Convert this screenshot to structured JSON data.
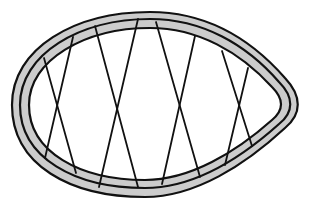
{
  "diagram": {
    "type": "teardrop-ring-with-crossed-struts",
    "colors": {
      "background": "#ffffff",
      "band_fill": "#cccccc",
      "stroke": "#111111"
    },
    "outer_path": "M 150 12 C 205 12 250 38 285 78 C 302 96 302 114 285 128 C 245 165 195 197 145 197 C 70 197 12 165 12 105 C 12 48 75 12 150 12 Z",
    "middle_path": "M 150 19 C 202 19 246 44 279 82 C 294 97 294 112 279 124 C 240 159 193 188 145 188 C 75 188 20 158 20 105 C 20 54 80 19 150 19 Z",
    "inner_path": "M 150 28 C 198 28 240 52 272 87 C 284 99 284 110 272 120 C 236 152 190 180 145 180 C 80 180 29 152 29 105 C 29 60 85 28 150 28 Z",
    "struts": [
      {
        "id": "x1-a",
        "x1": 44,
        "y1": 58,
        "x2": 76,
        "y2": 173
      },
      {
        "id": "x1-b",
        "x1": 73,
        "y1": 37,
        "x2": 45,
        "y2": 158
      },
      {
        "id": "x2-a",
        "x1": 95,
        "y1": 26,
        "x2": 138,
        "y2": 187
      },
      {
        "id": "x2-b",
        "x1": 138,
        "y1": 19,
        "x2": 99,
        "y2": 187
      },
      {
        "id": "x3-a",
        "x1": 156,
        "y1": 22,
        "x2": 200,
        "y2": 177
      },
      {
        "id": "x3-b",
        "x1": 195,
        "y1": 36,
        "x2": 162,
        "y2": 184
      },
      {
        "id": "x4-a",
        "x1": 222,
        "y1": 51,
        "x2": 252,
        "y2": 146
      },
      {
        "id": "x4-b",
        "x1": 248,
        "y1": 68,
        "x2": 225,
        "y2": 165
      }
    ]
  }
}
